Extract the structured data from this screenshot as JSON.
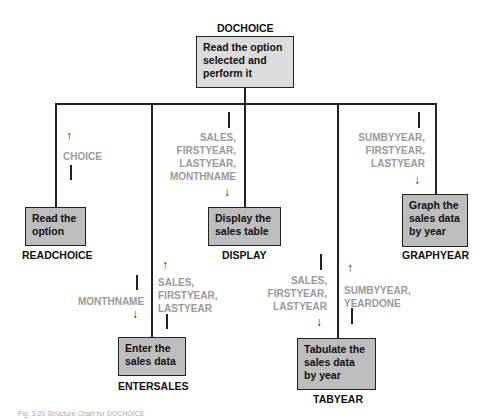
{
  "root": {
    "name": "DOCHOICE",
    "description": "Read the option selected and perform it"
  },
  "modules": [
    {
      "name": "READCHOICE",
      "description": "Read the option"
    },
    {
      "name": "ENTERSALES",
      "description": "Enter the sales data"
    },
    {
      "name": "DISPLAY",
      "description": "Display the sales table"
    },
    {
      "name": "TABYEAR",
      "description": "Tabulate the sales data by year"
    },
    {
      "name": "GRAPHYEAR",
      "description": "Graph the sales data by year"
    }
  ],
  "flows": {
    "readchoice_up": {
      "direction": "up",
      "params": [
        "CHOICE"
      ]
    },
    "entersales_down": {
      "direction": "down",
      "params": [
        "MONTHNAME"
      ]
    },
    "entersales_up": {
      "direction": "up",
      "params": [
        "SALES,",
        "FIRSTYEAR,",
        "LASTYEAR"
      ]
    },
    "display_down": {
      "direction": "down",
      "params": [
        "SALES,",
        "FIRSTYEAR,",
        "LASTYEAR,",
        "MONTHNAME"
      ]
    },
    "tabyear_down": {
      "direction": "down",
      "params": [
        "SALES,",
        "FIRSTYEAR,",
        "LASTYEAR"
      ]
    },
    "tabyear_up": {
      "direction": "up",
      "params": [
        "SUMBYYEAR,",
        "YEARDONE"
      ]
    },
    "graphyear_down": {
      "direction": "down",
      "params": [
        "SUMBYYEAR,",
        "FIRSTYEAR,",
        "LASTYEAR"
      ]
    }
  },
  "glyphs": {
    "up_arrow": "↑",
    "down_arrow": "↓"
  },
  "caption": "Fig. 3.20 Structure Chart for DOCHOICE"
}
